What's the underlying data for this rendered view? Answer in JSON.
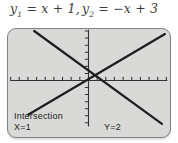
{
  "figure": {
    "title": {
      "y1_base": "y",
      "y1_sub": "1",
      "y1_eq": " = x + 1,",
      "y2_base": "y",
      "y2_sub": "2",
      "y2_eq": " = −x + 3"
    }
  },
  "calculator_screen": {
    "labels": {
      "intersection": "Intersection",
      "x_value": "X=1",
      "y_value": "Y=2"
    },
    "colors": {
      "screen_bg": "#d9d9d7",
      "screen_border": "#808183",
      "plot_line": "#1e1e1e",
      "axis": "#333333",
      "label_text": "#1d1d1d",
      "title_text": "#3d3d3d"
    }
  },
  "chart_data": {
    "type": "line",
    "series": [
      {
        "name": "y1",
        "equation": "y = x + 1"
      },
      {
        "name": "y2",
        "equation": "y = -x + 3"
      }
    ],
    "intersection": {
      "x": 1,
      "y": 2
    },
    "annotations": [
      "Intersection",
      "X=1",
      "Y=2"
    ],
    "axes": {
      "tick_labels": "none",
      "x_ticks_visible": 18,
      "y_ticks_visible": 13,
      "xlim": [
        -9,
        9
      ],
      "ylim": [
        -7,
        8
      ]
    },
    "grid": false,
    "legend": "none"
  }
}
